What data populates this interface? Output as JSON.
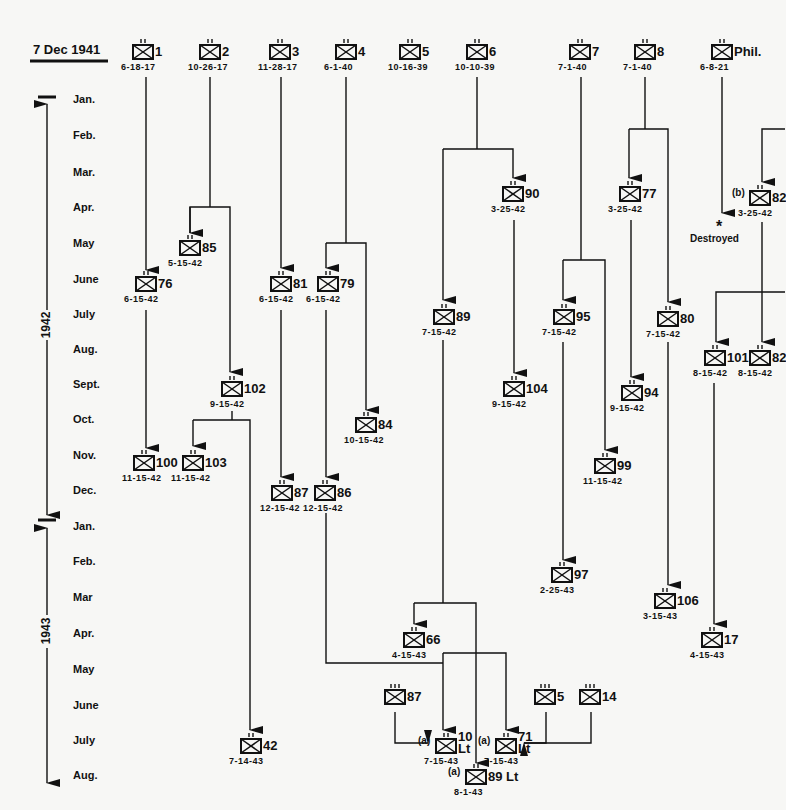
{
  "header": {
    "start_date": "7 Dec 1941"
  },
  "timeline": {
    "years": [
      "1942",
      "1943"
    ],
    "months": [
      {
        "label": "Jan.",
        "y": 100
      },
      {
        "label": "Feb.",
        "y": 136
      },
      {
        "label": "Mar.",
        "y": 173
      },
      {
        "label": "Apr.",
        "y": 208
      },
      {
        "label": "May",
        "y": 244
      },
      {
        "label": "June",
        "y": 280
      },
      {
        "label": "July",
        "y": 315
      },
      {
        "label": "Aug.",
        "y": 350
      },
      {
        "label": "Sept.",
        "y": 385
      },
      {
        "label": "Oct.",
        "y": 420
      },
      {
        "label": "Nov.",
        "y": 456
      },
      {
        "label": "Dec.",
        "y": 491
      },
      {
        "label": "Jan.",
        "y": 527
      },
      {
        "label": "Feb.",
        "y": 562
      },
      {
        "label": "Mar",
        "y": 598
      },
      {
        "label": "Apr.",
        "y": 634
      },
      {
        "label": "May",
        "y": 670
      },
      {
        "label": "June",
        "y": 706
      },
      {
        "label": "July",
        "y": 741
      },
      {
        "label": "Aug.",
        "y": 776
      }
    ]
  },
  "units": [
    {
      "id": "1",
      "date": "6-18-17",
      "x": 143,
      "y": 48,
      "echelon": "xx"
    },
    {
      "id": "2",
      "date": "10-26-17",
      "x": 210,
      "y": 48,
      "echelon": "xx"
    },
    {
      "id": "3",
      "date": "11-28-17",
      "x": 280,
      "y": 48,
      "echelon": "xx"
    },
    {
      "id": "4",
      "date": "6-1-40",
      "x": 346,
      "y": 48,
      "echelon": "xx"
    },
    {
      "id": "5",
      "date": "10-16-39",
      "x": 410,
      "y": 48,
      "echelon": "xx"
    },
    {
      "id": "6",
      "date": "10-10-39",
      "x": 477,
      "y": 48,
      "echelon": "xx"
    },
    {
      "id": "7",
      "date": "7-1-40",
      "x": 580,
      "y": 48,
      "echelon": "xx"
    },
    {
      "id": "8",
      "date": "7-1-40",
      "x": 645,
      "y": 48,
      "echelon": "xx"
    },
    {
      "id": "Phil.",
      "date": "6-8-21",
      "x": 722,
      "y": 48,
      "echelon": "xx"
    },
    {
      "id": "90",
      "date": "3-25-42",
      "x": 513,
      "y": 190,
      "echelon": "xx"
    },
    {
      "id": "77",
      "date": "3-25-42",
      "x": 630,
      "y": 190,
      "echelon": "xx"
    },
    {
      "id": "82",
      "date": "3-25-42",
      "x": 760,
      "y": 194,
      "echelon": "xx",
      "prefix": "(b)"
    },
    {
      "id": "85",
      "date": "5-15-42",
      "x": 190,
      "y": 244,
      "echelon": "xx"
    },
    {
      "id": "76",
      "date": "6-15-42",
      "x": 146,
      "y": 280,
      "echelon": "xx"
    },
    {
      "id": "81",
      "date": "6-15-42",
      "x": 281,
      "y": 280,
      "echelon": "xx"
    },
    {
      "id": "79",
      "date": "6-15-42",
      "x": 328,
      "y": 280,
      "echelon": "xx"
    },
    {
      "id": "89",
      "date": "7-15-42",
      "x": 444,
      "y": 313,
      "echelon": "xx"
    },
    {
      "id": "95",
      "date": "7-15-42",
      "x": 564,
      "y": 313,
      "echelon": "xx"
    },
    {
      "id": "80",
      "date": "7-15-42",
      "x": 668,
      "y": 315,
      "echelon": "xx"
    },
    {
      "id": "101",
      "date": "8-15-42",
      "x": 715,
      "y": 354,
      "echelon": "xx"
    },
    {
      "id": "82",
      "date": "8-15-42",
      "x": 760,
      "y": 354,
      "echelon": "xx"
    },
    {
      "id": "104",
      "date": "9-15-42",
      "x": 514,
      "y": 385,
      "echelon": "xx"
    },
    {
      "id": "102",
      "date": "9-15-42",
      "x": 232,
      "y": 385,
      "echelon": "xx"
    },
    {
      "id": "94",
      "date": "9-15-42",
      "x": 632,
      "y": 389,
      "echelon": "xx"
    },
    {
      "id": "84",
      "date": "10-15-42",
      "x": 366,
      "y": 421,
      "echelon": "xx"
    },
    {
      "id": "100",
      "date": "11-15-42",
      "x": 144,
      "y": 459,
      "echelon": "xx"
    },
    {
      "id": "103",
      "date": "11-15-42",
      "x": 193,
      "y": 459,
      "echelon": "xx"
    },
    {
      "id": "99",
      "date": "11-15-42",
      "x": 605,
      "y": 462,
      "echelon": "xx"
    },
    {
      "id": "87",
      "date": "12-15-42",
      "x": 282,
      "y": 489,
      "echelon": "xx"
    },
    {
      "id": "86",
      "date": "12-15-42",
      "x": 325,
      "y": 489,
      "echelon": "xx"
    },
    {
      "id": "97",
      "date": "2-25-43",
      "x": 562,
      "y": 571,
      "echelon": "xx"
    },
    {
      "id": "106",
      "date": "3-15-43",
      "x": 665,
      "y": 597,
      "echelon": "xx"
    },
    {
      "id": "17",
      "date": "4-15-43",
      "x": 712,
      "y": 636,
      "echelon": "xx"
    },
    {
      "id": "66",
      "date": "4-15-43",
      "x": 414,
      "y": 636,
      "echelon": "xx"
    },
    {
      "id": "87",
      "date": "",
      "x": 395,
      "y": 693,
      "echelon": "iii"
    },
    {
      "id": "5",
      "date": "",
      "x": 545,
      "y": 693,
      "echelon": "iii"
    },
    {
      "id": "14",
      "date": "",
      "x": 590,
      "y": 693,
      "echelon": "iii"
    },
    {
      "id": "10 Lt",
      "date": "7-15-43",
      "x": 446,
      "y": 742,
      "echelon": "xx",
      "prefix": "(a)"
    },
    {
      "id": "71 Lt",
      "date": "7-15-43",
      "x": 506,
      "y": 742,
      "echelon": "xx",
      "prefix": "(a)"
    },
    {
      "id": "89 Lt",
      "date": "8-1-43",
      "x": 476,
      "y": 773,
      "echelon": "xx",
      "prefix": "(a)"
    },
    {
      "id": "42",
      "date": "7-14-43",
      "x": 251,
      "y": 742,
      "echelon": "xx"
    }
  ],
  "annotations": {
    "destroyed": "Destroyed"
  },
  "colors": {
    "ink": "#111111",
    "paper": "#f7f7f5"
  }
}
